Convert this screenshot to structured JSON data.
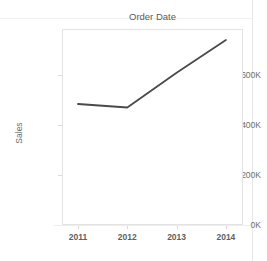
{
  "chart_data": {
    "type": "line",
    "title": "Order Date",
    "xlabel": "",
    "ylabel": "Sales",
    "categories": [
      "2011",
      "2012",
      "2013",
      "2014"
    ],
    "x_tick_labels": [
      "2011",
      "2012",
      "2013",
      "2014"
    ],
    "y_tick_labels": [
      "0K",
      "200K",
      "400K",
      "600K"
    ],
    "y_tick_values": [
      0,
      200000,
      400000,
      600000
    ],
    "ylim": [
      0,
      784000
    ],
    "xlim": [
      "2010.7",
      "2014.35"
    ],
    "grid": false,
    "legend": false,
    "legend_position": "none",
    "series": [
      {
        "name": "Sales",
        "color": "#4a4a4a",
        "values": [
          484000,
          470000,
          609000,
          740000
        ]
      }
    ],
    "annotations": []
  },
  "top_clipped_text": "",
  "colors": {
    "line": "#4a4a4a",
    "frame": "#e3e3e3",
    "text": "#6e6e6e",
    "background": "#ffffff"
  }
}
